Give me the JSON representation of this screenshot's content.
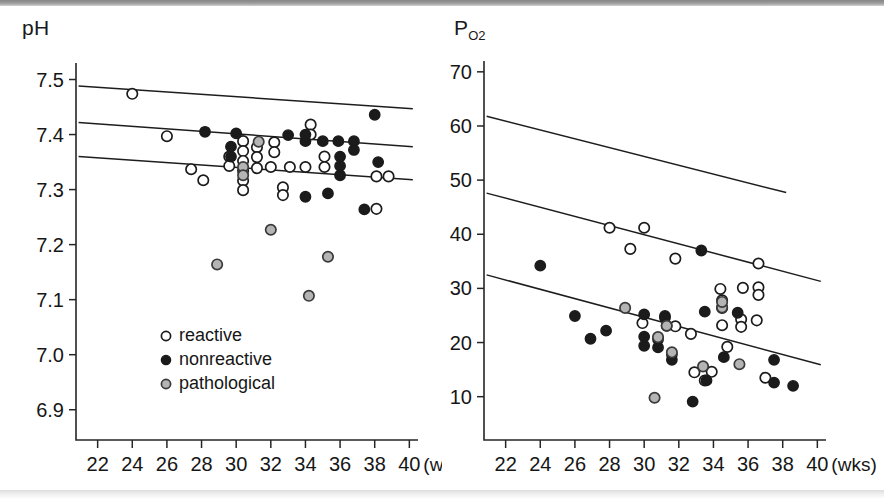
{
  "figure": {
    "background": "#ffffff",
    "panel_count": 2
  },
  "legend": {
    "position": "inside-left-panel-lower-left",
    "items": [
      {
        "key": "reactive",
        "label": "reactive",
        "marker": "open-circle",
        "fill": "#ffffff",
        "stroke": "#1b1b1b"
      },
      {
        "key": "nonreactive",
        "label": "nonreactive",
        "marker": "filled-circle",
        "fill": "#1b1b1b",
        "stroke": "#1b1b1b"
      },
      {
        "key": "pathological",
        "label": "pathological",
        "marker": "gray-circle",
        "fill": "#b4b4b4",
        "stroke": "#3a3a3a"
      }
    ]
  },
  "chart_data": [
    {
      "id": "ph-panel",
      "type": "scatter",
      "title": "",
      "ylabel": "pH",
      "ylabel_sub": "",
      "xlabel": "",
      "xunit": "(wks)",
      "xlim": [
        20.75,
        40.5
      ],
      "ylim": [
        6.845,
        7.53
      ],
      "xticks": [
        22,
        24,
        26,
        28,
        30,
        32,
        34,
        36,
        38,
        40
      ],
      "yticks": [
        7.5,
        7.4,
        7.3,
        7.2,
        7.1,
        7.0,
        6.9
      ],
      "ytick_labels": [
        "7.5",
        "7.4",
        "7.3",
        "7.2",
        "7.1",
        "7.0",
        "6.9"
      ],
      "xtick_labels": [
        "22",
        "24",
        "26",
        "28",
        "30",
        "32",
        "34",
        "36",
        "38",
        "40"
      ],
      "grid": false,
      "regression_lines": [
        {
          "name": "upper-limit",
          "x": [
            20.9,
            40.2
          ],
          "y": [
            7.488,
            7.447
          ]
        },
        {
          "name": "mean",
          "x": [
            20.9,
            40.2
          ],
          "y": [
            7.422,
            7.378
          ]
        },
        {
          "name": "lower-limit",
          "x": [
            20.9,
            40.2
          ],
          "y": [
            7.36,
            7.318
          ]
        }
      ],
      "series": [
        {
          "name": "reactive",
          "marker": "open-circle",
          "points": [
            [
              24.0,
              7.474
            ],
            [
              26.0,
              7.397
            ],
            [
              27.4,
              7.337
            ],
            [
              28.1,
              7.317
            ],
            [
              29.6,
              7.36
            ],
            [
              29.6,
              7.343
            ],
            [
              30.4,
              7.388
            ],
            [
              30.4,
              7.37
            ],
            [
              30.4,
              7.352
            ],
            [
              30.4,
              7.334
            ],
            [
              30.4,
              7.316
            ],
            [
              30.4,
              7.299
            ],
            [
              31.2,
              7.377
            ],
            [
              31.2,
              7.359
            ],
            [
              31.2,
              7.339
            ],
            [
              32.0,
              7.341
            ],
            [
              32.2,
              7.386
            ],
            [
              32.2,
              7.368
            ],
            [
              32.7,
              7.304
            ],
            [
              32.7,
              7.29
            ],
            [
              33.1,
              7.341
            ],
            [
              34.0,
              7.341
            ],
            [
              34.3,
              7.418
            ],
            [
              34.3,
              7.4
            ],
            [
              35.1,
              7.36
            ],
            [
              35.1,
              7.341
            ],
            [
              38.1,
              7.324
            ],
            [
              38.8,
              7.324
            ],
            [
              38.1,
              7.265
            ]
          ]
        },
        {
          "name": "nonreactive",
          "marker": "filled-circle",
          "points": [
            [
              28.2,
              7.405
            ],
            [
              30.0,
              7.402
            ],
            [
              29.7,
              7.378
            ],
            [
              29.7,
              7.36
            ],
            [
              33.0,
              7.399
            ],
            [
              34.0,
              7.388
            ],
            [
              34.0,
              7.4
            ],
            [
              35.0,
              7.388
            ],
            [
              35.9,
              7.388
            ],
            [
              36.8,
              7.388
            ],
            [
              36.8,
              7.372
            ],
            [
              36.0,
              7.36
            ],
            [
              36.0,
              7.343
            ],
            [
              36.0,
              7.326
            ],
            [
              38.0,
              7.436
            ],
            [
              38.2,
              7.35
            ],
            [
              34.0,
              7.287
            ],
            [
              35.3,
              7.293
            ],
            [
              37.4,
              7.264
            ]
          ]
        },
        {
          "name": "pathological",
          "marker": "gray-circle",
          "points": [
            [
              31.3,
              7.387
            ],
            [
              30.4,
              7.341
            ],
            [
              30.4,
              7.326
            ],
            [
              32.0,
              7.227
            ],
            [
              28.9,
              7.164
            ],
            [
              35.3,
              7.178
            ],
            [
              34.2,
              7.107
            ]
          ]
        }
      ]
    },
    {
      "id": "po2-panel",
      "type": "scatter",
      "title": "",
      "ylabel": "P",
      "ylabel_sub": "O2",
      "xlabel": "",
      "xunit": "(wks)",
      "xlim": [
        20.75,
        40.5
      ],
      "ylim": [
        2.0,
        72.0
      ],
      "xticks": [
        22,
        24,
        26,
        28,
        30,
        32,
        34,
        36,
        38,
        40
      ],
      "yticks": [
        70,
        60,
        50,
        40,
        30,
        20,
        10
      ],
      "ytick_labels": [
        "70",
        "60",
        "50",
        "40",
        "30",
        "20",
        "10"
      ],
      "xtick_labels": [
        "22",
        "24",
        "26",
        "28",
        "30",
        "32",
        "34",
        "36",
        "38",
        "40"
      ],
      "grid": false,
      "regression_lines": [
        {
          "name": "upper-limit",
          "x": [
            20.9,
            38.2
          ],
          "y": [
            61.8,
            47.7
          ]
        },
        {
          "name": "mean",
          "x": [
            20.9,
            40.2
          ],
          "y": [
            47.6,
            31.3
          ]
        },
        {
          "name": "lower-limit",
          "x": [
            20.9,
            40.2
          ],
          "y": [
            32.5,
            15.9
          ]
        }
      ],
      "series": [
        {
          "name": "reactive",
          "marker": "open-circle",
          "points": [
            [
              28.0,
              41.2
            ],
            [
              30.0,
              41.2
            ],
            [
              29.2,
              37.3
            ],
            [
              31.8,
              35.5
            ],
            [
              29.9,
              23.6
            ],
            [
              31.8,
              23.0
            ],
            [
              32.7,
              21.6
            ],
            [
              34.4,
              29.9
            ],
            [
              34.5,
              27.8
            ],
            [
              34.5,
              26.4
            ],
            [
              34.5,
              23.2
            ],
            [
              35.7,
              30.1
            ],
            [
              36.6,
              30.2
            ],
            [
              36.6,
              28.8
            ],
            [
              35.6,
              24.3
            ],
            [
              35.6,
              22.9
            ],
            [
              36.5,
              24.1
            ],
            [
              36.6,
              34.6
            ],
            [
              34.8,
              19.2
            ],
            [
              33.9,
              14.6
            ],
            [
              32.9,
              14.5
            ],
            [
              37.0,
              13.5
            ],
            [
              33.5,
              13.0
            ]
          ]
        },
        {
          "name": "nonreactive",
          "marker": "filled-circle",
          "points": [
            [
              24.0,
              34.2
            ],
            [
              26.0,
              24.9
            ],
            [
              26.9,
              20.7
            ],
            [
              27.8,
              22.2
            ],
            [
              30.0,
              25.2
            ],
            [
              31.2,
              24.9
            ],
            [
              31.2,
              24.6
            ],
            [
              31.3,
              23.1
            ],
            [
              33.3,
              37.0
            ],
            [
              33.5,
              25.7
            ],
            [
              35.4,
              25.5
            ],
            [
              30.0,
              21.1
            ],
            [
              30.0,
              19.4
            ],
            [
              30.8,
              20.6
            ],
            [
              30.8,
              19.1
            ],
            [
              31.6,
              17.8
            ],
            [
              31.6,
              16.8
            ],
            [
              34.6,
              17.3
            ],
            [
              37.5,
              16.8
            ],
            [
              33.6,
              13.0
            ],
            [
              37.5,
              12.6
            ],
            [
              38.6,
              12.0
            ],
            [
              32.8,
              9.1
            ]
          ]
        },
        {
          "name": "pathological",
          "marker": "gray-circle",
          "points": [
            [
              28.9,
              26.4
            ],
            [
              30.8,
              21.0
            ],
            [
              31.3,
              23.1
            ],
            [
              31.6,
              18.2
            ],
            [
              34.5,
              26.5
            ],
            [
              34.5,
              27.5
            ],
            [
              33.4,
              15.6
            ],
            [
              35.5,
              16.0
            ],
            [
              30.6,
              9.8
            ]
          ]
        }
      ]
    }
  ]
}
